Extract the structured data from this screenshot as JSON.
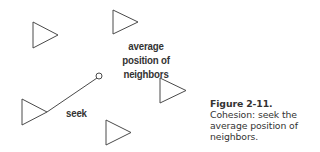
{
  "diagram": {
    "stroke_color": "#4a4a4a",
    "agents": [
      {
        "name": "agent-1",
        "left": 33,
        "top": 22,
        "bottom": 48,
        "tip_x": 58
      },
      {
        "name": "agent-2",
        "left": 113,
        "top": 10,
        "bottom": 34,
        "tip_x": 138
      },
      {
        "name": "agent-seeker",
        "left": 22,
        "top": 99,
        "bottom": 125,
        "tip_x": 47
      },
      {
        "name": "agent-4",
        "left": 160,
        "top": 78,
        "bottom": 103,
        "tip_x": 186
      },
      {
        "name": "agent-5",
        "left": 106,
        "top": 120,
        "bottom": 145,
        "tip_x": 131
      }
    ],
    "seek_line": {
      "x1": 47,
      "y1": 112,
      "x2": 97,
      "y2": 78
    },
    "target_point": {
      "cx": 99,
      "cy": 76,
      "r": 3
    },
    "labels": {
      "average_position": [
        "average",
        "position of",
        "neighbors"
      ],
      "seek": "seek"
    }
  },
  "caption": {
    "figure": "Figure 2-11.",
    "lines": [
      "Cohesion: seek the",
      "average position of",
      "neighbors."
    ]
  }
}
